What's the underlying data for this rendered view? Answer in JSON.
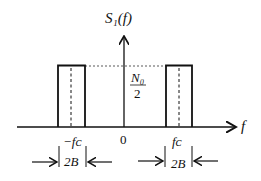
{
  "diagram": {
    "y_axis_label": "S₁(f)",
    "x_axis_label": "f",
    "level_label_num": "N₀",
    "level_label_den": "2",
    "origin_label": "0",
    "neg_center_label": "−fᴄ",
    "pos_center_label": "fᴄ",
    "bandwidth_label_left": "2B",
    "bandwidth_label_right": "2B"
  }
}
